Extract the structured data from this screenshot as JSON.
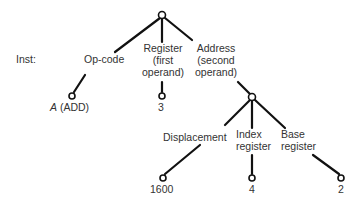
{
  "diagram": {
    "type": "tree",
    "row_label": "Inst:",
    "root": {
      "children": [
        {
          "edge_label": "Op-code",
          "leaf": {
            "symbol": "A",
            "text": "(ADD)"
          }
        },
        {
          "edge_label_lines": [
            "Register",
            "(first",
            "operand)"
          ],
          "leaf": {
            "text": "3"
          }
        },
        {
          "edge_label_lines": [
            "Address",
            "(second",
            "operand)"
          ],
          "children": [
            {
              "edge_label": "Displacement",
              "leaf": {
                "text": "1600"
              }
            },
            {
              "edge_label_lines": [
                "Index",
                "register"
              ],
              "leaf": {
                "text": "4"
              }
            },
            {
              "edge_label_lines": [
                "Base",
                "register"
              ],
              "leaf": {
                "text": "2"
              }
            }
          ]
        }
      ]
    }
  }
}
